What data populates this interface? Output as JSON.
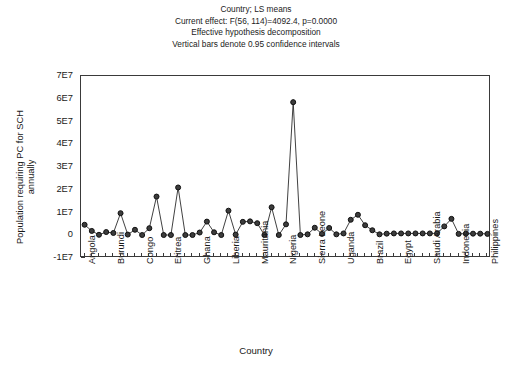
{
  "title": {
    "line1": "Country; LS means",
    "line2": "Current effect: F(56, 114)=4092.4, p=0.0000",
    "line3": "Effective hypothesis decomposition",
    "line4": "Vertical bars denote 0.95 confidence intervals"
  },
  "axes": {
    "x_title": "Country",
    "y_title_line1": "Population requiring PC for SCH",
    "y_title_line2": "annually"
  },
  "colors": {
    "line": "#2b2b2b",
    "marker_fill": "#3c3c3c",
    "marker_edge": "#111111",
    "frame": "#3a3a3a",
    "text": "#191919",
    "background": "#ffffff"
  },
  "chart_data": {
    "type": "line",
    "title": "Country; LS means",
    "subtitle": "Current effect: F(56, 114)=4092.4, p=0.0000 / Effective hypothesis decomposition / Vertical bars denote 0.95 confidence intervals",
    "xlabel": "Country",
    "ylabel": "Population requiring PC for SCH annually",
    "ylim": [
      -10000000,
      70000000
    ],
    "yticks": [
      -10000000,
      0,
      10000000,
      20000000,
      30000000,
      40000000,
      50000000,
      60000000,
      70000000
    ],
    "ytick_labels": [
      "-1E7",
      "0",
      "1E7",
      "2E7",
      "3E7",
      "4E7",
      "5E7",
      "6E7",
      "7E7"
    ],
    "grid": false,
    "legend": null,
    "marker": "circle",
    "n_points": 57,
    "xtick_labels_shown": [
      "Angola",
      "Burundi",
      "Congo",
      "Eritrea",
      "Ghana",
      "Liberia",
      "Mauritania",
      "Nigeria",
      "Sierra Leone",
      "Uganda",
      "Brazil",
      "Egypt",
      "Saudi Arabia",
      "Indonesia",
      "Philippines"
    ],
    "xtick_label_interval": 4,
    "xtick_label_first_index": 0,
    "categories": [
      "Angola",
      "",
      "",
      "",
      "Burundi",
      "",
      "",
      "",
      "Congo",
      "",
      "",
      "",
      "Eritrea",
      "",
      "",
      "",
      "Ghana",
      "",
      "",
      "",
      "Liberia",
      "",
      "",
      "",
      "Mauritania",
      "",
      "",
      "",
      "Nigeria",
      "",
      "",
      "",
      "Sierra Leone",
      "",
      "",
      "",
      "Uganda",
      "",
      "",
      "",
      "Brazil",
      "",
      "",
      "",
      "Egypt",
      "",
      "",
      "",
      "Saudi Arabia",
      "",
      "",
      "",
      "Indonesia",
      "",
      "",
      "",
      "Philippines"
    ],
    "values": [
      4600000,
      1900000,
      200000,
      1400000,
      1000000,
      9700000,
      300000,
      2400000,
      100000,
      3100000,
      17000000,
      100000,
      100000,
      21000000,
      100000,
      100000,
      1200000,
      6000000,
      1300000,
      100000,
      10800000,
      300000,
      5900000,
      6100000,
      5300000,
      100000,
      12300000,
      100000,
      4800000,
      58500000,
      100000,
      400000,
      3300000,
      600000,
      3200000,
      400000,
      800000,
      6800000,
      9000000,
      4400000,
      2200000,
      400000,
      700000,
      800000,
      800000,
      800000,
      800000,
      800000,
      800000,
      800000,
      3900000,
      7200000,
      600000,
      700000,
      700000,
      700000,
      600000
    ],
    "error_bars": {
      "present": true,
      "confidence": 0.95,
      "note": "Vertical bars denote 0.95 confidence intervals; bars are smaller than markers at this scale."
    }
  }
}
